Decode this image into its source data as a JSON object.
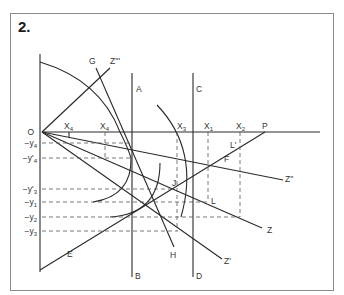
{
  "figure": {
    "number": "2."
  },
  "labels": {
    "O": "O",
    "G": "G",
    "Z4": "Z'''",
    "A": "A",
    "B": "B",
    "C": "C",
    "D": "D",
    "P": "P",
    "X4p": "X",
    "X4p_sub": "4",
    "X4p_prime": "'",
    "X4": "X",
    "X4_sub": "4",
    "X3": "X",
    "X3_sub": "3",
    "X1": "X",
    "X1_sub": "1",
    "X2": "X",
    "X2_sub": "2",
    "Lp": "L'",
    "F": "F",
    "Z3": "Z''",
    "J": "J",
    "L": "L",
    "Z": "Z",
    "H": "H",
    "Z1": "Z'",
    "E": "E",
    "ny4": "−y",
    "ny4_sub": "4",
    "ny4p": "−y'",
    "ny4p_sub": "4",
    "ny3p": "−y'",
    "ny3p_sub": "3",
    "ny1": "−y",
    "ny1_sub": "1",
    "ny2": "−y",
    "ny2_sub": "2",
    "ny3": "−y",
    "ny3_sub": "3"
  },
  "colors": {
    "line": "#2a2a2a",
    "dashed": "#555555",
    "frame": "#8a8a8a"
  }
}
